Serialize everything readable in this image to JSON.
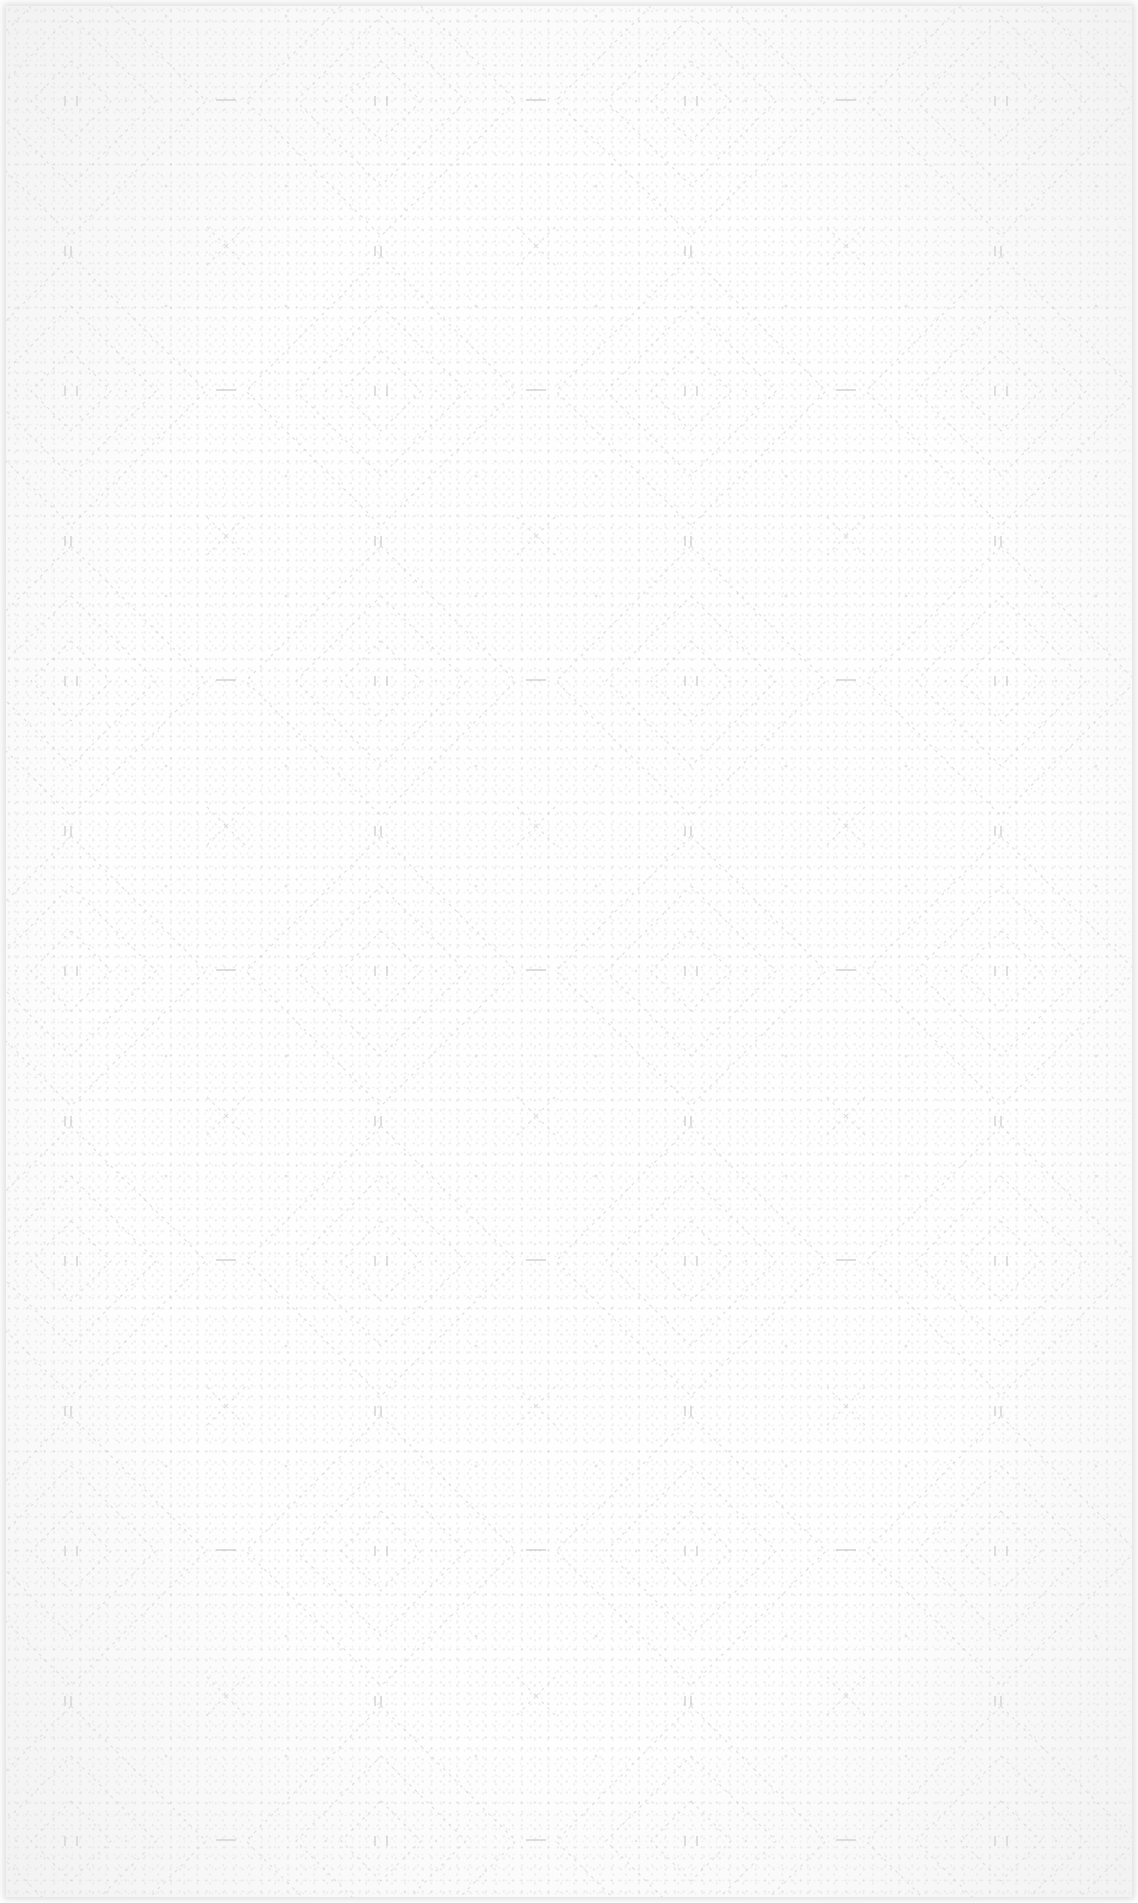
{
  "image": {
    "subject": "embossed white paper towel texture",
    "background_color": "#fefefe",
    "edge_shadow_color": "#d8d8d8",
    "pattern": "repeating diamond / quilted emboss",
    "pattern_tile_width": 310,
    "pattern_tile_height": 290
  }
}
